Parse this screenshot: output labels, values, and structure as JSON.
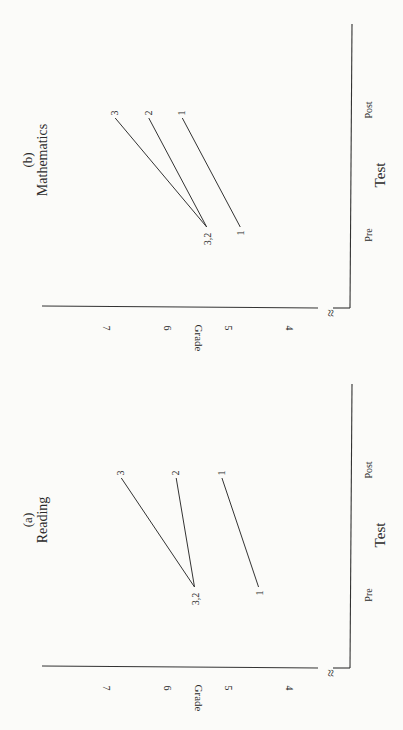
{
  "chart_data": [
    {
      "type": "line",
      "panel": "(a)",
      "title": "Reading",
      "xlabel": "Test",
      "ylabel": "Grade",
      "categories": [
        "Pre",
        "Post"
      ],
      "yticks": [
        4,
        5,
        6,
        7
      ],
      "ylim": [
        3.6,
        7.6
      ],
      "axis_break": true,
      "series": [
        {
          "name": "1",
          "values": [
            4.45,
            5.05
          ]
        },
        {
          "name": "2",
          "values": [
            5.5,
            5.8
          ]
        },
        {
          "name": "3",
          "values": [
            5.5,
            6.7
          ]
        }
      ],
      "pre_labels": [
        "3,2",
        "1"
      ],
      "post_labels": [
        "3",
        "2",
        "1"
      ]
    },
    {
      "type": "line",
      "panel": "(b)",
      "title": "Mathematics",
      "xlabel": "Test",
      "ylabel": "Grade",
      "categories": [
        "Pre",
        "Post"
      ],
      "yticks": [
        4,
        5,
        6,
        7
      ],
      "ylim": [
        3.6,
        7.6
      ],
      "axis_break": true,
      "series": [
        {
          "name": "1",
          "values": [
            4.75,
            5.7
          ]
        },
        {
          "name": "2",
          "values": [
            5.3,
            6.25
          ]
        },
        {
          "name": "3",
          "values": [
            5.3,
            6.8
          ]
        }
      ],
      "pre_labels": [
        "3,2",
        "1"
      ],
      "post_labels": [
        "3",
        "2",
        "1"
      ]
    }
  ],
  "orientation": "rotated 90° counter-clockwise",
  "axis_break_glyph": "≈"
}
